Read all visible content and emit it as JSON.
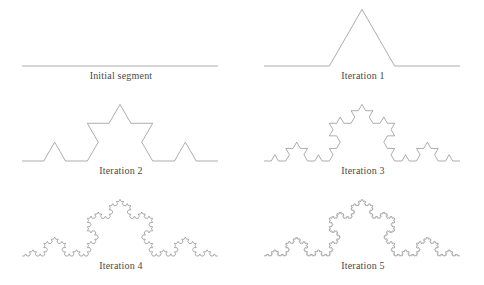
{
  "figure": {
    "width": 484,
    "height": 285,
    "background_color": "#ffffff",
    "stroke_color": "#8a8a8a",
    "stroke_width": 0.7,
    "label_color": "#4a4a4a",
    "label_font_size": 10,
    "columns": 2,
    "rows": 3
  },
  "panels": [
    {
      "label": "Initial segment",
      "iteration": 0,
      "row": 0,
      "col": 0,
      "origin_x": 0,
      "origin_y": 0,
      "curve": {
        "x_start": 22,
        "x_end": 218,
        "baseline_y": 66,
        "segment_length": 196,
        "peak_height": 0,
        "vertex_count": 2
      }
    },
    {
      "label": "Iteration 1",
      "iteration": 1,
      "row": 0,
      "col": 1,
      "origin_x": 242,
      "origin_y": 0,
      "curve": {
        "x_start": 22,
        "x_end": 218,
        "baseline_y": 66,
        "segment_length": 196,
        "peak_height": 56.58,
        "vertex_count": 5
      }
    },
    {
      "label": "Iteration 2",
      "iteration": 2,
      "row": 1,
      "col": 0,
      "origin_x": 0,
      "origin_y": 95,
      "curve": {
        "x_start": 22,
        "x_end": 218,
        "baseline_y": 66,
        "segment_length": 196,
        "peak_height": 56.58,
        "vertex_count": 17
      }
    },
    {
      "label": "Iteration 3",
      "iteration": 3,
      "row": 1,
      "col": 1,
      "origin_x": 242,
      "origin_y": 95,
      "curve": {
        "x_start": 22,
        "x_end": 218,
        "baseline_y": 66,
        "segment_length": 196,
        "peak_height": 56.58,
        "vertex_count": 65
      }
    },
    {
      "label": "Iteration 4",
      "iteration": 4,
      "row": 2,
      "col": 0,
      "origin_x": 0,
      "origin_y": 190,
      "curve": {
        "x_start": 22,
        "x_end": 218,
        "baseline_y": 66,
        "segment_length": 196,
        "peak_height": 56.58,
        "vertex_count": 257
      }
    },
    {
      "label": "Iteration 5",
      "iteration": 5,
      "row": 2,
      "col": 1,
      "origin_x": 242,
      "origin_y": 190,
      "curve": {
        "x_start": 22,
        "x_end": 218,
        "baseline_y": 66,
        "segment_length": 196,
        "peak_height": 56.58,
        "vertex_count": 1025
      }
    }
  ]
}
